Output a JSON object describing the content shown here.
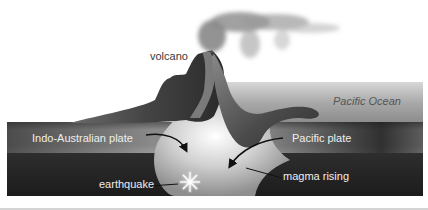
{
  "diagram": {
    "type": "subduction-zone-cross-section",
    "labels": {
      "volcano": "volcano",
      "ocean": "Pacific Ocean",
      "left_plate": "Indo-Australian plate",
      "right_plate": "Pacific plate",
      "earthquake": "earthquake",
      "magma": "magma rising"
    },
    "icons": {
      "earthquake": "starburst-icon",
      "plate_motion": "curved-arrow-icon"
    },
    "colors": {
      "background": "#ffffff",
      "ocean": "#9a9a9a",
      "plate_band": "#7a7a7a",
      "mantle": "#262626",
      "land": "#3e3e3e",
      "magma_chamber": "#dcdcdc",
      "smoke": "#8c8c8c"
    }
  }
}
